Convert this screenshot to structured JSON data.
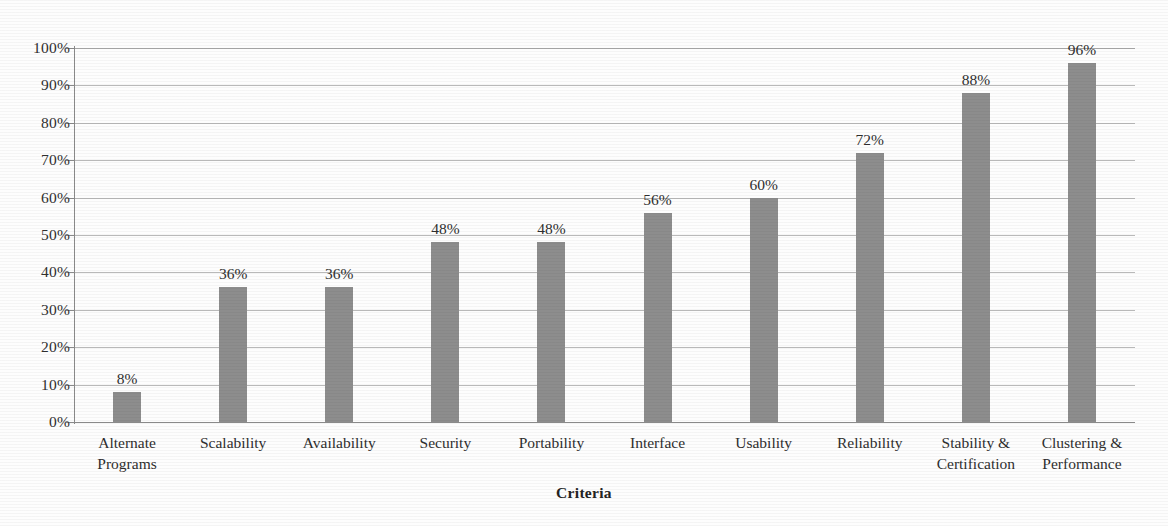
{
  "chart_data": {
    "type": "bar",
    "title": "",
    "xlabel": "Criteria",
    "ylabel": "",
    "ylim": [
      0,
      100
    ],
    "grid": true,
    "legend": "none",
    "orientation": "vertical",
    "bar_color": "#8d8d8d",
    "background_color": "#ffffff",
    "axis_color": "#8a8a8a",
    "gridline_color": "#b9b9b9",
    "y_ticks": [
      "0%",
      "10%",
      "20%",
      "30%",
      "40%",
      "50%",
      "60%",
      "70%",
      "80%",
      "90%",
      "100%"
    ],
    "y_tick_values": [
      0,
      10,
      20,
      30,
      40,
      50,
      60,
      70,
      80,
      90,
      100
    ],
    "categories": [
      "Alternate Programs",
      "Scalability",
      "Availability",
      "Security",
      "Portability",
      "Interface",
      "Usability",
      "Reliability",
      "Stability & Certification",
      "Clustering & Performance"
    ],
    "category_lines": [
      [
        "Alternate",
        "Programs"
      ],
      [
        "Scalability"
      ],
      [
        "Availability"
      ],
      [
        "Security"
      ],
      [
        "Portability"
      ],
      [
        "Interface"
      ],
      [
        "Usability"
      ],
      [
        "Reliability"
      ],
      [
        "Stability &",
        "Certification"
      ],
      [
        "Clustering &",
        "Performance"
      ]
    ],
    "values": [
      8,
      36,
      36,
      48,
      48,
      56,
      60,
      72,
      88,
      96
    ],
    "value_labels": [
      "8%",
      "36%",
      "36%",
      "48%",
      "48%",
      "56%",
      "60%",
      "72%",
      "88%",
      "96%"
    ]
  }
}
